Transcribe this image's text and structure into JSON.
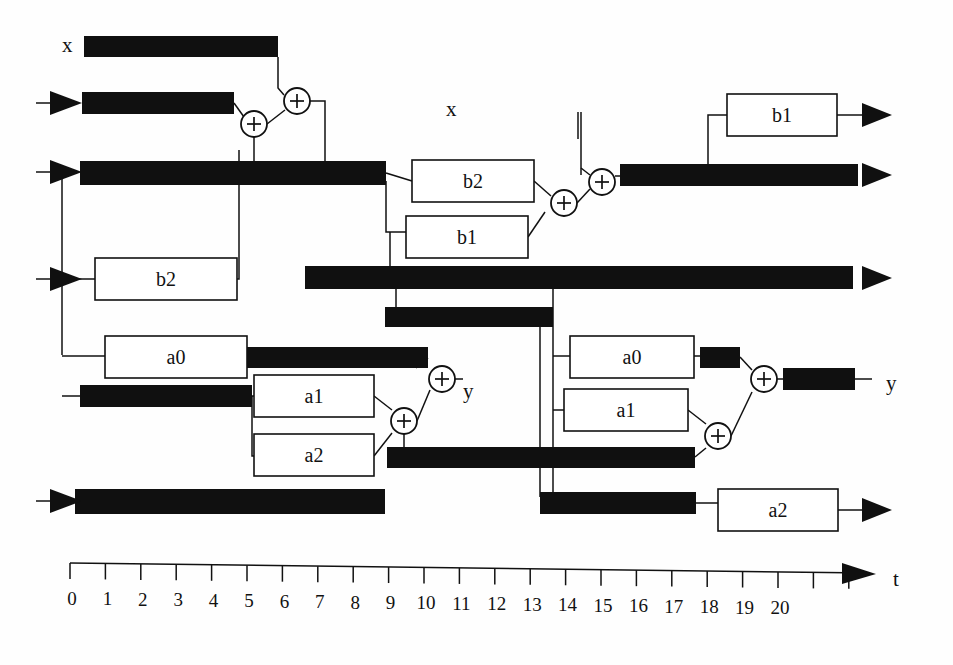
{
  "diagram": {
    "signal_labels": [
      {
        "name": "x-label-left",
        "text": "x",
        "x": 62,
        "y": 52
      },
      {
        "name": "x-label-mid",
        "text": "x",
        "x": 446,
        "y": 116
      },
      {
        "name": "y-label-left",
        "text": "y",
        "x": 463,
        "y": 398
      },
      {
        "name": "y-label-right",
        "text": "y",
        "x": 886,
        "y": 390
      },
      {
        "name": "t-label",
        "text": "t",
        "x": 893,
        "y": 586
      }
    ],
    "coefficient_boxes": [
      {
        "name": "box-b2-left",
        "label": "b2",
        "x": 95,
        "y": 258,
        "w": 142,
        "h": 42
      },
      {
        "name": "box-a0-left",
        "label": "a0",
        "x": 105,
        "y": 336,
        "w": 142,
        "h": 42
      },
      {
        "name": "box-a1-left",
        "label": "a1",
        "x": 254,
        "y": 375,
        "w": 120,
        "h": 42
      },
      {
        "name": "box-a2-left",
        "label": "a2",
        "x": 254,
        "y": 434,
        "w": 120,
        "h": 42
      },
      {
        "name": "box-b2-mid",
        "label": "b2",
        "x": 412,
        "y": 160,
        "w": 122,
        "h": 42
      },
      {
        "name": "box-b1-mid",
        "label": "b1",
        "x": 406,
        "y": 216,
        "w": 122,
        "h": 42
      },
      {
        "name": "box-b1-right",
        "label": "b1",
        "x": 727,
        "y": 94,
        "w": 110,
        "h": 42
      },
      {
        "name": "box-a0-right",
        "label": "a0",
        "x": 570,
        "y": 336,
        "w": 124,
        "h": 42
      },
      {
        "name": "box-a1-right",
        "label": "a1",
        "x": 564,
        "y": 389,
        "w": 124,
        "h": 42
      },
      {
        "name": "box-a2-right",
        "label": "a2",
        "x": 718,
        "y": 489,
        "w": 120,
        "h": 42
      }
    ],
    "adders": [
      {
        "name": "adder-1",
        "cx": 254,
        "cy": 124,
        "r": 13
      },
      {
        "name": "adder-2",
        "cx": 297,
        "cy": 101,
        "r": 13
      },
      {
        "name": "adder-3",
        "cx": 564,
        "cy": 203,
        "r": 13
      },
      {
        "name": "adder-4",
        "cx": 602,
        "cy": 182,
        "r": 13
      },
      {
        "name": "adder-5",
        "cx": 404,
        "cy": 421,
        "r": 13
      },
      {
        "name": "adder-6",
        "cx": 442,
        "cy": 379,
        "r": 13
      },
      {
        "name": "adder-7",
        "cx": 718,
        "cy": 436,
        "r": 13
      },
      {
        "name": "adder-8",
        "cx": 764,
        "cy": 379,
        "r": 13
      }
    ],
    "latency_bars": [
      {
        "name": "bar-x-top",
        "x": 84,
        "y": 36,
        "w": 194,
        "h": 21,
        "t_start": 0.4,
        "t_end": 5.9
      },
      {
        "name": "bar-row2-left",
        "x": 82,
        "y": 92,
        "w": 152,
        "h": 22,
        "t_start": 0.3,
        "t_end": 4.6
      },
      {
        "name": "bar-row3-long",
        "x": 80,
        "y": 161,
        "w": 306,
        "h": 24,
        "t_start": 0.3,
        "t_end": 9.0
      },
      {
        "name": "bar-out-b",
        "x": 620,
        "y": 164,
        "w": 238,
        "h": 22,
        "t_start": 15.5,
        "t_end": 22.0
      },
      {
        "name": "bar-row4-long",
        "x": 305,
        "y": 266,
        "w": 548,
        "h": 23,
        "t_start": 6.6,
        "t_end": 22.0
      },
      {
        "name": "bar-row5",
        "x": 385,
        "y": 307,
        "w": 168,
        "h": 20,
        "t_start": 8.9,
        "t_end": 13.6
      },
      {
        "name": "bar-a0-left-out",
        "x": 234,
        "y": 347,
        "w": 194,
        "h": 21,
        "t_start": 4.6,
        "t_end": 10.1
      },
      {
        "name": "bar-row-a1-in",
        "x": 80,
        "y": 385,
        "w": 172,
        "h": 22,
        "t_start": 0.3,
        "t_end": 5.1
      },
      {
        "name": "bar-a2-left-out",
        "x": 387,
        "y": 447,
        "w": 308,
        "h": 21,
        "t_start": 8.9,
        "t_end": 17.6
      },
      {
        "name": "bar-bottom-left",
        "x": 75,
        "y": 489,
        "w": 310,
        "h": 25,
        "t_start": 0.1,
        "t_end": 8.9
      },
      {
        "name": "bar-bottom-mid",
        "x": 540,
        "y": 492,
        "w": 156,
        "h": 22,
        "t_start": 13.3,
        "t_end": 17.7
      },
      {
        "name": "bar-a0-right-out",
        "x": 700,
        "y": 347,
        "w": 40,
        "h": 21,
        "t_start": 17.8,
        "t_end": 18.9
      },
      {
        "name": "bar-y-right-out",
        "x": 783,
        "y": 368,
        "w": 72,
        "h": 22,
        "t_start": 20.1,
        "t_end": 22.1
      }
    ],
    "input_arrows": [
      {
        "name": "input-arrow-row2",
        "x": 48,
        "y": 103
      },
      {
        "name": "input-arrow-row3",
        "x": 48,
        "y": 172
      },
      {
        "name": "input-arrow-b2",
        "x": 48,
        "y": 279
      },
      {
        "name": "input-arrow-bot",
        "x": 48,
        "y": 501
      }
    ],
    "output_arrows": [
      {
        "name": "output-arrow-b1-right",
        "x": 862,
        "y": 115
      },
      {
        "name": "output-arrow-b-row",
        "x": 862,
        "y": 175
      },
      {
        "name": "output-arrow-row4",
        "x": 862,
        "y": 278
      },
      {
        "name": "output-arrow-a2-right",
        "x": 862,
        "y": 510
      }
    ],
    "axis": {
      "name": "time-axis",
      "label": "t",
      "x0": 70,
      "y": 563,
      "x_end": 860,
      "tick_spacing": 35.4,
      "tick_height": 16,
      "num_ticks": 23,
      "labels": [
        "0",
        "1",
        "2",
        "3",
        "4",
        "5",
        "6",
        "7",
        "8",
        "9",
        "10",
        "11",
        "12",
        "13",
        "14",
        "15",
        "16",
        "17",
        "18",
        "19",
        "20"
      ]
    },
    "colors": {
      "ink": "#111111",
      "bar_fill": "#101010",
      "background": "#ffffff"
    }
  }
}
